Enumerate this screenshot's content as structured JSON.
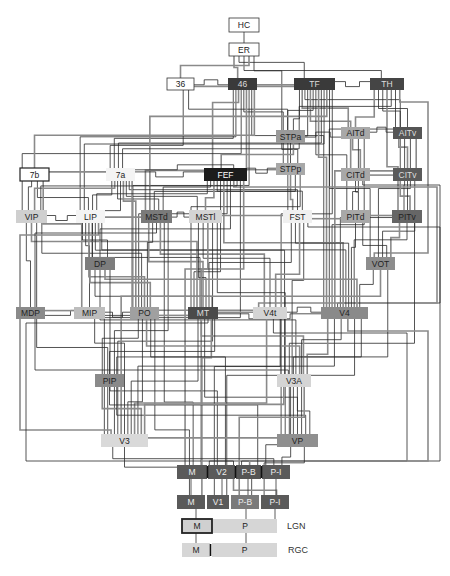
{
  "diagram": {
    "nodes": [
      {
        "id": "HC",
        "label": "HC",
        "x": 229,
        "y": 18,
        "w": 30,
        "h": 14,
        "fill": "#ffffff",
        "text": "#222222",
        "border": "#333333"
      },
      {
        "id": "ER",
        "label": "ER",
        "x": 229,
        "y": 43,
        "w": 30,
        "h": 13,
        "fill": "#ffffff",
        "text": "#222222",
        "border": "#333333"
      },
      {
        "id": "36",
        "label": "36",
        "x": 167,
        "y": 78,
        "w": 27,
        "h": 12,
        "fill": "#ffffff",
        "text": "#222222",
        "border": "#333333"
      },
      {
        "id": "46",
        "label": "46",
        "x": 228,
        "y": 78,
        "w": 29,
        "h": 12,
        "fill": "#3a3a3a",
        "text": "#dddddd"
      },
      {
        "id": "TF",
        "label": "TF",
        "x": 294,
        "y": 78,
        "w": 41,
        "h": 12,
        "fill": "#3a3a3a",
        "text": "#dddddd"
      },
      {
        "id": "TH",
        "label": "TH",
        "x": 370,
        "y": 78,
        "w": 34,
        "h": 12,
        "fill": "#454545",
        "text": "#dddddd"
      },
      {
        "id": "STPa",
        "label": "STPa",
        "x": 276,
        "y": 130,
        "w": 29,
        "h": 13,
        "fill": "#9a9a9a",
        "text": "#222222"
      },
      {
        "id": "AITd",
        "label": "AITd",
        "x": 341,
        "y": 127,
        "w": 29,
        "h": 12,
        "fill": "#a8a8a8",
        "text": "#222222"
      },
      {
        "id": "AITv",
        "label": "AITv",
        "x": 393,
        "y": 127,
        "w": 29,
        "h": 12,
        "fill": "#555555",
        "text": "#dddddd"
      },
      {
        "id": "STPp",
        "label": "STPp",
        "x": 276,
        "y": 163,
        "w": 29,
        "h": 12,
        "fill": "#a8a8a8",
        "text": "#222222"
      },
      {
        "id": "CITd",
        "label": "CITd",
        "x": 341,
        "y": 168,
        "w": 29,
        "h": 13,
        "fill": "#a8a8a8",
        "text": "#222222"
      },
      {
        "id": "CITv",
        "label": "CITv",
        "x": 393,
        "y": 168,
        "w": 29,
        "h": 13,
        "fill": "#5a5a5a",
        "text": "#dddddd"
      },
      {
        "id": "7b",
        "label": "7b",
        "x": 20,
        "y": 168,
        "w": 29,
        "h": 13,
        "fill": "#ffffff",
        "text": "#222222",
        "border": "#222222",
        "borderWidth": 1.2
      },
      {
        "id": "7a",
        "label": "7a",
        "x": 106,
        "y": 168,
        "w": 29,
        "h": 13,
        "fill": "#f4f4f4",
        "text": "#222222"
      },
      {
        "id": "FEF",
        "label": "FEF",
        "x": 204,
        "y": 168,
        "w": 43,
        "h": 13,
        "fill": "#1c1c1c",
        "text": "#ffffff"
      },
      {
        "id": "VIP",
        "label": "VIP",
        "x": 16,
        "y": 210,
        "w": 31,
        "h": 13,
        "fill": "#cfcfcf",
        "text": "#222222"
      },
      {
        "id": "LIP",
        "label": "LIP",
        "x": 76,
        "y": 210,
        "w": 29,
        "h": 13,
        "fill": "#f4f4f4",
        "text": "#222222"
      },
      {
        "id": "MSTd",
        "label": "MSTd",
        "x": 141,
        "y": 210,
        "w": 31,
        "h": 13,
        "fill": "#7a7a7a",
        "text": "#222222"
      },
      {
        "id": "MSTl",
        "label": "MSTl",
        "x": 189,
        "y": 210,
        "w": 33,
        "h": 13,
        "fill": "#d4d4d4",
        "text": "#222222"
      },
      {
        "id": "FST",
        "label": "FST",
        "x": 283,
        "y": 210,
        "w": 29,
        "h": 13,
        "fill": "#f0f0f0",
        "text": "#222222"
      },
      {
        "id": "PITd",
        "label": "PITd",
        "x": 341,
        "y": 210,
        "w": 29,
        "h": 13,
        "fill": "#a8a8a8",
        "text": "#222222"
      },
      {
        "id": "PITv",
        "label": "PITv",
        "x": 392,
        "y": 210,
        "w": 30,
        "h": 13,
        "fill": "#666666",
        "text": "#222222"
      },
      {
        "id": "DP",
        "label": "DP",
        "x": 85,
        "y": 257,
        "w": 30,
        "h": 13,
        "fill": "#7d7d7d",
        "text": "#222222"
      },
      {
        "id": "VOT",
        "label": "VOT",
        "x": 366,
        "y": 257,
        "w": 29,
        "h": 13,
        "fill": "#8d8d8d",
        "text": "#222222"
      },
      {
        "id": "MDP",
        "label": "MDP",
        "x": 16,
        "y": 307,
        "w": 29,
        "h": 12,
        "fill": "#8a8a8a",
        "text": "#222222"
      },
      {
        "id": "MIP",
        "label": "MIP",
        "x": 74,
        "y": 307,
        "w": 31,
        "h": 12,
        "fill": "#bdbdbd",
        "text": "#222222"
      },
      {
        "id": "PO",
        "label": "PO",
        "x": 130,
        "y": 307,
        "w": 29,
        "h": 12,
        "fill": "#a0a0a0",
        "text": "#222222"
      },
      {
        "id": "MT",
        "label": "MT",
        "x": 188,
        "y": 307,
        "w": 30,
        "h": 12,
        "fill": "#4a4a4a",
        "text": "#dddddd"
      },
      {
        "id": "V4t",
        "label": "V4t",
        "x": 253,
        "y": 307,
        "w": 34,
        "h": 12,
        "fill": "#d4d4d4",
        "text": "#222222"
      },
      {
        "id": "V4",
        "label": "V4",
        "x": 321,
        "y": 307,
        "w": 47,
        "h": 12,
        "fill": "#8a8a8a",
        "text": "#222222"
      },
      {
        "id": "PIP",
        "label": "PIP",
        "x": 95,
        "y": 374,
        "w": 29,
        "h": 13,
        "fill": "#8a8a8a",
        "text": "#222222"
      },
      {
        "id": "V3A",
        "label": "V3A",
        "x": 277,
        "y": 374,
        "w": 34,
        "h": 13,
        "fill": "#d4d4d4",
        "text": "#222222"
      },
      {
        "id": "V3",
        "label": "V3",
        "x": 101,
        "y": 434,
        "w": 47,
        "h": 13,
        "fill": "#d9d9d9",
        "text": "#222222"
      },
      {
        "id": "VP",
        "label": "VP",
        "x": 277,
        "y": 434,
        "w": 41,
        "h": 13,
        "fill": "#8f8f8f",
        "text": "#222222"
      }
    ],
    "strips": [
      {
        "id": "V2",
        "y": 465,
        "h": 14,
        "segments": [
          {
            "label": "M",
            "x": 177,
            "w": 30,
            "fill": "#5a5a5a",
            "text": "#eeeeee"
          },
          {
            "label": "V2",
            "x": 208,
            "w": 27,
            "fill": "#5a5a5a",
            "text": "#eeeeee"
          },
          {
            "label": "P-B",
            "x": 236,
            "w": 25,
            "fill": "#555555",
            "text": "#eeeeee"
          },
          {
            "label": "P-I",
            "x": 262,
            "w": 28,
            "fill": "#5a5a5a",
            "text": "#eeeeee"
          }
        ],
        "dividers": [
          207.5,
          235.5,
          261.5
        ]
      },
      {
        "id": "V1",
        "y": 495,
        "h": 14,
        "segments": [
          {
            "label": "M",
            "x": 177,
            "w": 28,
            "fill": "#5a5a5a",
            "text": "#eeeeee"
          },
          {
            "label": "V1",
            "x": 207,
            "w": 22,
            "fill": "#5a5a5a",
            "text": "#eeeeee"
          },
          {
            "label": "P-B",
            "x": 231,
            "w": 28,
            "fill": "#7a7a7a",
            "text": "#eeeeee"
          },
          {
            "label": "P-I",
            "x": 261,
            "w": 28,
            "fill": "#5a5a5a",
            "text": "#eeeeee"
          }
        ],
        "dividers": []
      },
      {
        "id": "LGN",
        "y": 519,
        "h": 14,
        "segments": [
          {
            "label": "M",
            "x": 182,
            "w": 30,
            "fill": "#d0d0d0",
            "text": "#222222",
            "border": "#222222",
            "borderWidth": 1.8
          },
          {
            "label": "P",
            "x": 213,
            "w": 64,
            "fill": "#d6d6d6",
            "text": "#222222"
          }
        ],
        "dividers": [],
        "side_label": "LGN",
        "side_x": 287
      },
      {
        "id": "RGC",
        "y": 543,
        "h": 14,
        "segments": [
          {
            "label": "M",
            "x": 182,
            "w": 28,
            "fill": "#d6d6d6",
            "text": "#222222"
          },
          {
            "label": "P",
            "x": 212,
            "w": 65,
            "fill": "#d6d6d6",
            "text": "#222222"
          }
        ],
        "dividers": [
          210.5
        ],
        "side_label": "RGC",
        "side_x": 288
      }
    ],
    "edges": [
      {
        "from": "HC",
        "to": "ER"
      },
      {
        "from": "ER",
        "to": "46"
      },
      {
        "from": "ER",
        "to": "TF"
      },
      {
        "from": "ER",
        "to": "TH"
      },
      {
        "from": "ER",
        "to": "36"
      },
      {
        "from": "ER",
        "to": "STPa"
      },
      {
        "from": "36",
        "to": "46"
      },
      {
        "from": "36",
        "to": "TF"
      },
      {
        "from": "36",
        "to": "7a"
      },
      {
        "from": "36",
        "to": "STPa"
      },
      {
        "from": "46",
        "to": "TF"
      },
      {
        "from": "46",
        "to": "7a"
      },
      {
        "from": "46",
        "to": "LIP"
      },
      {
        "from": "46",
        "to": "FEF"
      },
      {
        "from": "46",
        "to": "VIP"
      },
      {
        "from": "46",
        "to": "STPp"
      },
      {
        "from": "46",
        "to": "MSTd"
      },
      {
        "from": "46",
        "to": "PO"
      },
      {
        "from": "46",
        "to": "V4"
      },
      {
        "from": "46",
        "to": "7b"
      },
      {
        "from": "TF",
        "to": "TH"
      },
      {
        "from": "TF",
        "to": "STPa"
      },
      {
        "from": "TF",
        "to": "AITd"
      },
      {
        "from": "TF",
        "to": "AITv"
      },
      {
        "from": "TF",
        "to": "STPp"
      },
      {
        "from": "TF",
        "to": "CITd"
      },
      {
        "from": "TF",
        "to": "FST"
      },
      {
        "from": "TF",
        "to": "PITd"
      },
      {
        "from": "TF",
        "to": "V4"
      },
      {
        "from": "TF",
        "to": "7a"
      },
      {
        "from": "TF",
        "to": "LIP"
      },
      {
        "from": "TF",
        "to": "MSTd"
      },
      {
        "from": "TF",
        "to": "VOT"
      },
      {
        "from": "TF",
        "to": "VP"
      },
      {
        "from": "TH",
        "to": "AITd"
      },
      {
        "from": "TH",
        "to": "AITv"
      },
      {
        "from": "TH",
        "to": "CITv"
      },
      {
        "from": "TH",
        "to": "PITv"
      },
      {
        "from": "TH",
        "to": "STPa"
      },
      {
        "from": "TH",
        "to": "V4"
      },
      {
        "from": "TH",
        "to": "VOT"
      },
      {
        "from": "STPa",
        "to": "STPp"
      },
      {
        "from": "STPa",
        "to": "AITd"
      },
      {
        "from": "STPa",
        "to": "FEF"
      },
      {
        "from": "STPa",
        "to": "7a"
      },
      {
        "from": "AITd",
        "to": "AITv"
      },
      {
        "from": "AITd",
        "to": "CITd"
      },
      {
        "from": "AITd",
        "to": "PITd"
      },
      {
        "from": "AITd",
        "to": "V4"
      },
      {
        "from": "AITv",
        "to": "CITv"
      },
      {
        "from": "AITv",
        "to": "PITv"
      },
      {
        "from": "AITv",
        "to": "VOT"
      },
      {
        "from": "AITv",
        "to": "V4"
      },
      {
        "from": "STPp",
        "to": "FEF"
      },
      {
        "from": "STPp",
        "to": "7a"
      },
      {
        "from": "STPp",
        "to": "FST"
      },
      {
        "from": "STPp",
        "to": "MSTd"
      },
      {
        "from": "STPp",
        "to": "MT"
      },
      {
        "from": "CITd",
        "to": "CITv"
      },
      {
        "from": "CITd",
        "to": "PITd"
      },
      {
        "from": "CITd",
        "to": "V4"
      },
      {
        "from": "CITv",
        "to": "PITv"
      },
      {
        "from": "CITv",
        "to": "V4"
      },
      {
        "from": "CITv",
        "to": "VOT"
      },
      {
        "from": "7b",
        "to": "7a"
      },
      {
        "from": "7b",
        "to": "VIP"
      },
      {
        "from": "7b",
        "to": "LIP"
      },
      {
        "from": "7b",
        "to": "MIP"
      },
      {
        "from": "7a",
        "to": "FEF"
      },
      {
        "from": "7a",
        "to": "LIP"
      },
      {
        "from": "7a",
        "to": "VIP"
      },
      {
        "from": "7a",
        "to": "MSTd"
      },
      {
        "from": "7a",
        "to": "DP"
      },
      {
        "from": "7a",
        "to": "PO"
      },
      {
        "from": "7a",
        "to": "MSTl"
      },
      {
        "from": "7a",
        "to": "FST"
      },
      {
        "from": "7a",
        "to": "V3A"
      },
      {
        "from": "FEF",
        "to": "LIP"
      },
      {
        "from": "FEF",
        "to": "MSTd"
      },
      {
        "from": "FEF",
        "to": "MSTl"
      },
      {
        "from": "FEF",
        "to": "FST"
      },
      {
        "from": "FEF",
        "to": "MT"
      },
      {
        "from": "FEF",
        "to": "V4"
      },
      {
        "from": "FEF",
        "to": "PO"
      },
      {
        "from": "FEF",
        "to": "DP"
      },
      {
        "from": "FEF",
        "to": "V4t"
      },
      {
        "from": "FEF",
        "to": "VIP"
      },
      {
        "from": "FEF",
        "to": "V3"
      },
      {
        "from": "FEF",
        "to": "V2"
      },
      {
        "from": "VIP",
        "to": "LIP"
      },
      {
        "from": "VIP",
        "to": "MDP"
      },
      {
        "from": "VIP",
        "to": "MT"
      },
      {
        "from": "VIP",
        "to": "V3"
      },
      {
        "from": "VIP",
        "to": "PO"
      },
      {
        "from": "LIP",
        "to": "MSTd"
      },
      {
        "from": "LIP",
        "to": "DP"
      },
      {
        "from": "LIP",
        "to": "MIP"
      },
      {
        "from": "LIP",
        "to": "PO"
      },
      {
        "from": "LIP",
        "to": "MT"
      },
      {
        "from": "LIP",
        "to": "V3A"
      },
      {
        "from": "LIP",
        "to": "V3"
      },
      {
        "from": "LIP",
        "to": "V4"
      },
      {
        "from": "MSTd",
        "to": "MSTl"
      },
      {
        "from": "MSTd",
        "to": "MT"
      },
      {
        "from": "MSTd",
        "to": "PO"
      },
      {
        "from": "MSTd",
        "to": "V3A"
      },
      {
        "from": "MSTd",
        "to": "V4t"
      },
      {
        "from": "MSTd",
        "to": "V2"
      },
      {
        "from": "MSTd",
        "to": "V3"
      },
      {
        "from": "MSTl",
        "to": "FST"
      },
      {
        "from": "MSTl",
        "to": "MT"
      },
      {
        "from": "MSTl",
        "to": "V4t"
      },
      {
        "from": "MSTl",
        "to": "V2"
      },
      {
        "from": "MSTl",
        "to": "V3"
      },
      {
        "from": "MSTl",
        "to": "VP"
      },
      {
        "from": "FST",
        "to": "PITd"
      },
      {
        "from": "FST",
        "to": "MT"
      },
      {
        "from": "FST",
        "to": "V4"
      },
      {
        "from": "FST",
        "to": "V4t"
      },
      {
        "from": "FST",
        "to": "V3A"
      },
      {
        "from": "FST",
        "to": "V2"
      },
      {
        "from": "PITd",
        "to": "PITv"
      },
      {
        "from": "PITd",
        "to": "V4"
      },
      {
        "from": "PITd",
        "to": "VOT"
      },
      {
        "from": "PITv",
        "to": "VOT"
      },
      {
        "from": "PITv",
        "to": "V4"
      },
      {
        "from": "PITv",
        "to": "VP"
      },
      {
        "from": "DP",
        "to": "PO"
      },
      {
        "from": "DP",
        "to": "MT"
      },
      {
        "from": "DP",
        "to": "V3A"
      },
      {
        "from": "DP",
        "to": "V4"
      },
      {
        "from": "DP",
        "to": "V2"
      },
      {
        "from": "VOT",
        "to": "V4"
      },
      {
        "from": "VOT",
        "to": "V3"
      },
      {
        "from": "VOT",
        "to": "VP"
      },
      {
        "from": "MDP",
        "to": "PO"
      },
      {
        "from": "MDP",
        "to": "MIP"
      },
      {
        "from": "MIP",
        "to": "PO"
      },
      {
        "from": "MIP",
        "to": "V3"
      },
      {
        "from": "PO",
        "to": "MT"
      },
      {
        "from": "PO",
        "to": "PIP"
      },
      {
        "from": "PO",
        "to": "V3"
      },
      {
        "from": "PO",
        "to": "V3A"
      },
      {
        "from": "PO",
        "to": "V2"
      },
      {
        "from": "PO",
        "to": "V1"
      },
      {
        "from": "MT",
        "to": "V4t"
      },
      {
        "from": "MT",
        "to": "V4"
      },
      {
        "from": "MT",
        "to": "V3"
      },
      {
        "from": "MT",
        "to": "V3A"
      },
      {
        "from": "MT",
        "to": "VP"
      },
      {
        "from": "MT",
        "to": "V2"
      },
      {
        "from": "MT",
        "to": "V1"
      },
      {
        "from": "MT",
        "to": "PIP"
      },
      {
        "from": "V4t",
        "to": "V4"
      },
      {
        "from": "V4t",
        "to": "V3"
      },
      {
        "from": "V4t",
        "to": "V2"
      },
      {
        "from": "V4t",
        "to": "V1"
      },
      {
        "from": "V4",
        "to": "V3A"
      },
      {
        "from": "V4",
        "to": "V3"
      },
      {
        "from": "V4",
        "to": "VP"
      },
      {
        "from": "V4",
        "to": "V2"
      },
      {
        "from": "V4",
        "to": "V1"
      },
      {
        "from": "V4",
        "to": "PIP"
      },
      {
        "from": "PIP",
        "to": "V3"
      },
      {
        "from": "PIP",
        "to": "V2"
      },
      {
        "from": "PIP",
        "to": "VP"
      },
      {
        "from": "V3A",
        "to": "V3"
      },
      {
        "from": "V3A",
        "to": "V2"
      },
      {
        "from": "V3A",
        "to": "VP"
      },
      {
        "from": "V3A",
        "to": "V1"
      },
      {
        "from": "V3",
        "to": "V2"
      },
      {
        "from": "V3",
        "to": "V1"
      },
      {
        "from": "V3",
        "to": "VP"
      },
      {
        "from": "VP",
        "to": "V2"
      },
      {
        "from": "VP",
        "to": "V1"
      },
      {
        "from": "V2",
        "to": "V1"
      }
    ],
    "colors": {
      "edge_dark": "#2a2a2a",
      "edge_gray": "#8a8a8a",
      "background": "#ffffff"
    }
  }
}
